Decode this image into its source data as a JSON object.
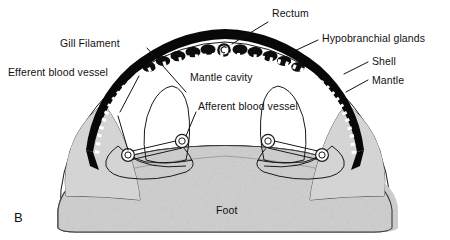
{
  "figure": {
    "panel_label": "B",
    "caption_foot": "Foot"
  },
  "labels": {
    "gill_filament": "Gill Filament",
    "efferent_blood_vessel": "Efferent blood vessel",
    "rectum": "Rectum",
    "hypobranchial_glands": "Hypobranchial glands",
    "shell": "Shell",
    "mantle": "Mantle",
    "mantle_cavity": "Mantle cavity",
    "afferent_blood_vessel": "Afferent blood vessel",
    "foot": "Foot"
  },
  "colors": {
    "background": "#ffffff",
    "ink": "#111111",
    "shell_black": "#080808",
    "mantle_white": "#ffffff",
    "foot_gray": "#a8a8a8",
    "outline": "#1a1a1a"
  },
  "structures": [
    {
      "name": "shell",
      "description": "thick black arch across the top"
    },
    {
      "name": "mantle",
      "description": "white dotted band lining the inner shell"
    },
    {
      "name": "hypobranchial-glands",
      "description": "scalloped dark lobes beneath the mantle"
    },
    {
      "name": "rectum",
      "description": "spiral cross-section at apex center"
    },
    {
      "name": "mantle-cavity",
      "description": "open white space between mantle and foot"
    },
    {
      "name": "gill-left",
      "description": "left ctenidium with afferent and efferent vessels"
    },
    {
      "name": "gill-right",
      "description": "right ctenidium with afferent and efferent vessels"
    },
    {
      "name": "foot",
      "description": "large stippled gray muscular mass at the base"
    }
  ]
}
